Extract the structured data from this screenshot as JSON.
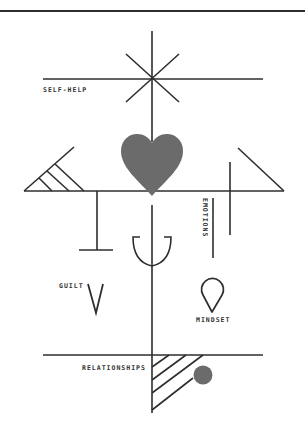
{
  "colors": {
    "background": "#ffffff",
    "stroke": "#2e2e2e",
    "fill": "#6b6b6b",
    "text": "#333333"
  },
  "labels": {
    "self_help": "SELF-HELP",
    "emotions": "EMOTIONS",
    "guilt": "GUILT",
    "mindset": "MINDSET",
    "relationships": "RELATIONSHIPS"
  },
  "symbols": [
    "asterisk-star-icon",
    "heart-icon",
    "hatched-triangle-icon",
    "t-bar-icon",
    "right-triangle-icon",
    "cross-line-icon",
    "trident-icon",
    "v-shape-icon",
    "drop-icon",
    "hatched-wedge-icon",
    "dot-icon"
  ]
}
